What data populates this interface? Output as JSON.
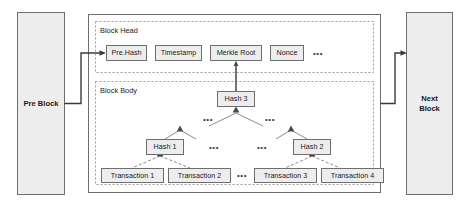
{
  "diagram": {
    "colors": {
      "box_fill": "#ededed",
      "box_stroke": "#6e6e6e",
      "section_stroke": "#9a9a9a",
      "link_stroke": "#3a3a3a",
      "tree_stroke": "#8c8c8c",
      "text": "#1a1a1a",
      "background": "#ffffff"
    },
    "side_blocks": {
      "previous": {
        "label": "Pre Block",
        "lines": [
          "Pre Block"
        ]
      },
      "next": {
        "label": "Next Block",
        "lines": [
          "Next",
          "Block"
        ]
      }
    },
    "sections": {
      "head": {
        "label": "Block Head"
      },
      "body": {
        "label": "Block Body"
      }
    },
    "head_fields": [
      {
        "label": "Pre.Hash"
      },
      {
        "label": "Timestamp"
      },
      {
        "label": "Merkle Root"
      },
      {
        "label": "Nonce"
      }
    ],
    "head_ellipsis": "•••",
    "merkle": {
      "root": {
        "label": "Hash 3"
      },
      "intermediate": [
        {
          "label": "Hash 1"
        },
        {
          "label": "Hash 2"
        }
      ],
      "leaves": [
        {
          "label": "Transaction 1"
        },
        {
          "label": "Transaction 2"
        },
        {
          "label": "Transaction 3"
        },
        {
          "label": "Transaction 4"
        }
      ],
      "ellipses": {
        "upper_left": "•••",
        "upper_right": "•••",
        "mid_left": "•••",
        "mid_right": "•••",
        "leaf_gap": "•••"
      }
    }
  }
}
